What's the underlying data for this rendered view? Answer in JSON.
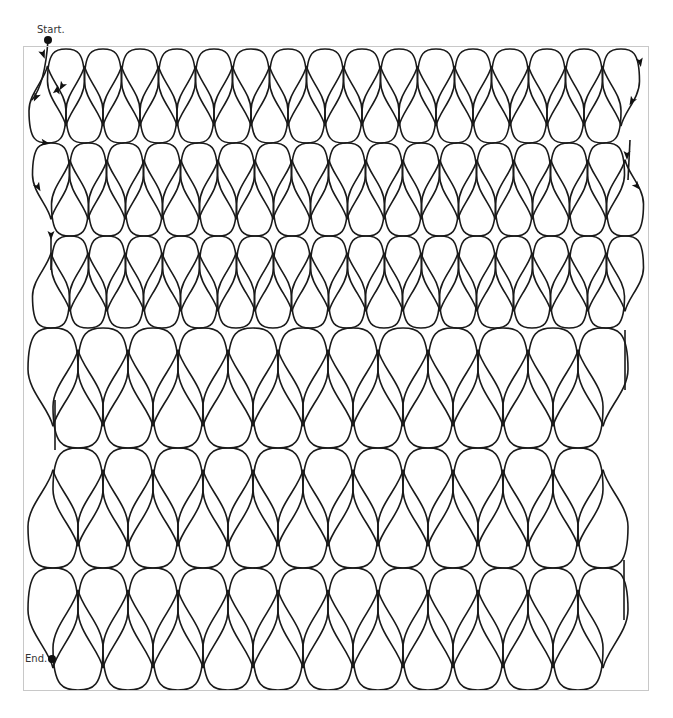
{
  "diagram": {
    "labels": {
      "start": "Start.",
      "end": "End."
    },
    "colors": {
      "stroke": "#1a1a1a",
      "frame": "#c8c8c8",
      "background": "#ffffff",
      "marker": "#111111"
    },
    "frame": {
      "x": 23,
      "y": 46,
      "width": 626,
      "height": 645
    },
    "markers": {
      "start": {
        "x": 48,
        "y": 40
      },
      "end": {
        "x": 52,
        "y": 659
      }
    },
    "sections": [
      {
        "name": "small-teardrops",
        "pitch": 37,
        "row_pairs": [
          {
            "top": 49,
            "neck": 95,
            "bottom": 143,
            "upper_first_cx": 66,
            "upper_count": 16,
            "lower_first_cx": 47.5,
            "lower_count": 16
          },
          {
            "top": 143,
            "neck": 189,
            "bottom": 236,
            "upper_first_cx": 51,
            "upper_count": 16,
            "lower_first_cx": 70,
            "lower_count": 16
          },
          {
            "top": 236,
            "neck": 282,
            "bottom": 328,
            "upper_first_cx": 70,
            "upper_count": 16,
            "lower_first_cx": 51,
            "lower_count": 16
          }
        ]
      },
      {
        "name": "large-teardrops",
        "pitch": 50,
        "row_pairs": [
          {
            "top": 328,
            "neck": 388,
            "bottom": 448,
            "upper_first_cx": 53,
            "upper_count": 12,
            "lower_first_cx": 78,
            "lower_count": 12
          },
          {
            "top": 448,
            "neck": 508,
            "bottom": 568,
            "upper_first_cx": 78,
            "upper_count": 12,
            "lower_first_cx": 53,
            "lower_count": 12
          },
          {
            "top": 568,
            "neck": 629,
            "bottom": 690,
            "upper_first_cx": 53,
            "upper_count": 12,
            "lower_first_cx": 78,
            "lower_count": 12
          }
        ]
      }
    ],
    "arrows": [
      {
        "x": 43,
        "y": 54,
        "angle": 70
      },
      {
        "x": 36,
        "y": 97,
        "angle": 115
      },
      {
        "x": 57,
        "y": 90,
        "angle": -80
      },
      {
        "x": 62,
        "y": 86,
        "angle": 120
      },
      {
        "x": 45,
        "y": 143,
        "angle": 10
      },
      {
        "x": 38,
        "y": 187,
        "angle": 60
      },
      {
        "x": 51,
        "y": 235,
        "angle": 90
      },
      {
        "x": 640,
        "y": 62,
        "angle": 80
      },
      {
        "x": 632,
        "y": 101,
        "angle": 120
      },
      {
        "x": 627,
        "y": 155,
        "angle": 90
      },
      {
        "x": 637,
        "y": 186,
        "angle": 50
      }
    ]
  }
}
